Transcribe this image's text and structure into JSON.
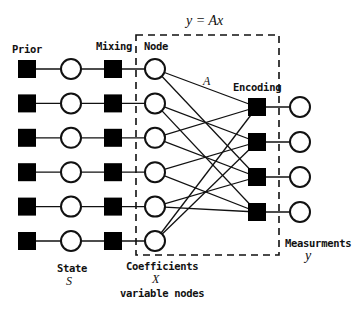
{
  "title_equation": "y = Ax",
  "matrix_label": "A",
  "column_labels": {
    "prior": "Prior",
    "mixing": "Mixing",
    "node": "Node",
    "encoding": "Encoding"
  },
  "bottom_labels": {
    "state": "State",
    "state_symbol": "S",
    "coefficients": "Coefficients",
    "coefficients_symbol": "X",
    "variable_nodes": "variable nodes",
    "measurements": "Measurments",
    "measurements_symbol": "y"
  },
  "graph": {
    "rows": 6,
    "encoders": 4,
    "edges": [
      {
        "node": 1,
        "encoder": 1
      },
      {
        "node": 1,
        "encoder": 3
      },
      {
        "node": 2,
        "encoder": 2
      },
      {
        "node": 2,
        "encoder": 4
      },
      {
        "node": 3,
        "encoder": 1
      },
      {
        "node": 3,
        "encoder": 3
      },
      {
        "node": 4,
        "encoder": 2
      },
      {
        "node": 4,
        "encoder": 4
      },
      {
        "node": 5,
        "encoder": 3
      },
      {
        "node": 5,
        "encoder": 4
      },
      {
        "node": 6,
        "encoder": 1
      },
      {
        "node": 6,
        "encoder": 2
      }
    ]
  },
  "colors": {
    "stroke": "#111111",
    "fill_factor": "#000000",
    "fill_variable": "#ffffff"
  }
}
